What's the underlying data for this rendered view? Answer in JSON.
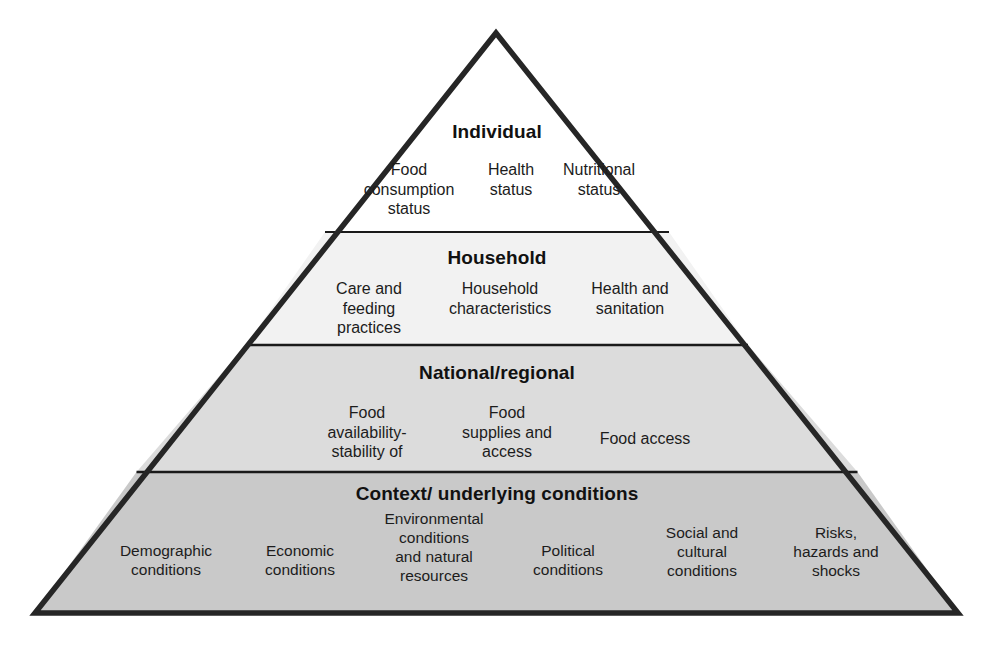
{
  "diagram": {
    "shape": "pyramid",
    "apex": {
      "x": 496,
      "y": 33
    },
    "base_left": {
      "x": 35,
      "y": 613
    },
    "base_right": {
      "x": 958,
      "y": 613
    },
    "outline_color": "#262626",
    "dividers_y": [
      232,
      345,
      472
    ]
  },
  "tiers": [
    {
      "id": "individual",
      "level": 1,
      "title": "Individual",
      "fill": "#ffffff",
      "items": [
        "Food\nconsumption\nstatus",
        "Health\nstatus",
        "Nutritional\nstatus"
      ],
      "items_flat": [
        "Food consumption status",
        "Health status",
        "Nutritional status"
      ]
    },
    {
      "id": "household",
      "level": 2,
      "title": "Household",
      "fill": "#f2f2f2",
      "items": [
        "Care and\nfeeding\npractices",
        "Household\ncharacteristics",
        "Health and\nsanitation"
      ],
      "items_flat": [
        "Care and feeding practices",
        "Household characteristics",
        "Health and sanitation"
      ]
    },
    {
      "id": "national",
      "level": 3,
      "title": "National/regional",
      "fill": "#dcdcdc",
      "items": [
        "Food\navailability-\nstability of",
        "Food\nsupplies and\naccess",
        "Food access"
      ],
      "items_flat": [
        "Food availability-stability of",
        "Food supplies and access",
        "Food access"
      ]
    },
    {
      "id": "context",
      "level": 4,
      "title": "Context/ underlying conditions",
      "fill": "#c9c9c9",
      "items": [
        "Demographic\nconditions",
        "Economic\nconditions",
        "Environmental\nconditions\nand natural\nresources",
        "Political\nconditions",
        "Social and\ncultural\nconditions",
        "Risks,\nhazards and\nshocks"
      ],
      "items_flat": [
        "Demographic conditions",
        "Economic conditions",
        "Environmental conditions and natural resources",
        "Political conditions",
        "Social and cultural conditions",
        "Risks, hazards and shocks"
      ]
    }
  ],
  "colors": {
    "outline": "#262626",
    "divider": "#1a1a1a",
    "text": "#1c1c1c",
    "tier1_fill": "#ffffff",
    "tier2_fill": "#f2f2f2",
    "tier3_fill": "#dcdcdc",
    "tier4_fill": "#c9c9c9",
    "background": "#ffffff"
  }
}
